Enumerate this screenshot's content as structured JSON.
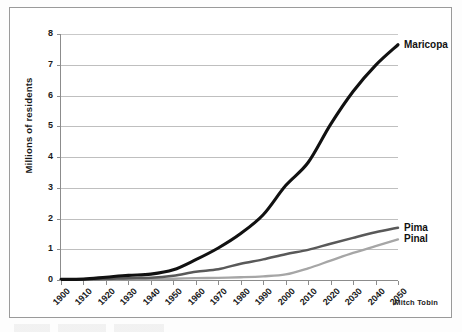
{
  "figure": {
    "credit": "Mitch Tobin"
  },
  "chart_data": {
    "type": "line",
    "title": "",
    "xlabel": "",
    "ylabel": "Millions of residents",
    "xlim": [
      1900,
      2050
    ],
    "ylim": [
      0,
      8
    ],
    "grid": true,
    "legend_position": "right-inline-labels",
    "x": [
      1900,
      1910,
      1920,
      1930,
      1940,
      1950,
      1960,
      1970,
      1980,
      1990,
      2000,
      2010,
      2020,
      2030,
      2040,
      2050
    ],
    "xtick_labels": [
      "1900",
      "1910",
      "1920",
      "1930",
      "1940",
      "1950",
      "1960",
      "1970",
      "1980",
      "1990",
      "2000",
      "2010",
      "2020",
      "2030",
      "2040",
      "2050"
    ],
    "ytick_labels": [
      "0",
      "1",
      "2",
      "3",
      "4",
      "5",
      "6",
      "7",
      "8"
    ],
    "ytick_values": [
      0,
      1,
      2,
      3,
      4,
      5,
      6,
      7,
      8
    ],
    "series": [
      {
        "name": "Maricopa",
        "color": "#111111",
        "values": [
          0.02,
          0.03,
          0.09,
          0.15,
          0.19,
          0.33,
          0.66,
          1.04,
          1.51,
          2.12,
          3.07,
          3.82,
          5.06,
          6.13,
          6.98,
          7.65
        ]
      },
      {
        "name": "Pima",
        "color": "#595959",
        "values": [
          0.01,
          0.02,
          0.03,
          0.06,
          0.07,
          0.14,
          0.27,
          0.35,
          0.53,
          0.67,
          0.84,
          0.98,
          1.18,
          1.37,
          1.55,
          1.7
        ]
      },
      {
        "name": "Pinal",
        "color": "#a6a6a6",
        "values": [
          0.01,
          0.01,
          0.02,
          0.03,
          0.03,
          0.04,
          0.06,
          0.07,
          0.09,
          0.12,
          0.18,
          0.38,
          0.63,
          0.88,
          1.1,
          1.32
        ]
      }
    ]
  }
}
